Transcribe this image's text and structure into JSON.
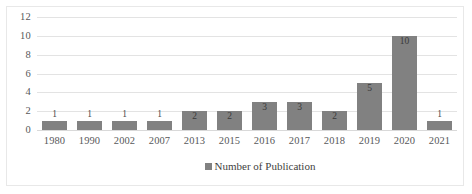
{
  "chart_data": {
    "type": "bar",
    "title": "",
    "xlabel": "",
    "ylabel": "",
    "categories": [
      "1980",
      "1990",
      "2002",
      "2007",
      "2013",
      "2015",
      "2016",
      "2017",
      "2018",
      "2019",
      "2020",
      "2021"
    ],
    "values": [
      1,
      1,
      1,
      1,
      2,
      2,
      3,
      3,
      2,
      5,
      10,
      1
    ],
    "data_labels": [
      "1",
      "1",
      "1",
      "1",
      "2",
      "2",
      "3",
      "3",
      "2",
      "5",
      "10",
      "1"
    ],
    "series": [
      {
        "name": "Number of Publication",
        "values": [
          1,
          1,
          1,
          1,
          2,
          2,
          3,
          3,
          2,
          5,
          10,
          1
        ]
      }
    ],
    "ylim": [
      0,
      12
    ],
    "yticks": [
      0,
      2,
      4,
      6,
      8,
      10,
      12
    ],
    "ytick_labels": [
      "0",
      "2",
      "4",
      "6",
      "8",
      "10",
      "12"
    ],
    "grid": "horizontal",
    "legend": {
      "position": "bottom",
      "entries": [
        "Number of Publication"
      ]
    },
    "colors": {
      "bar": "#818181",
      "gridline": "#e3e3e3",
      "text": "#58585a",
      "border": "#e8e8e8"
    }
  }
}
